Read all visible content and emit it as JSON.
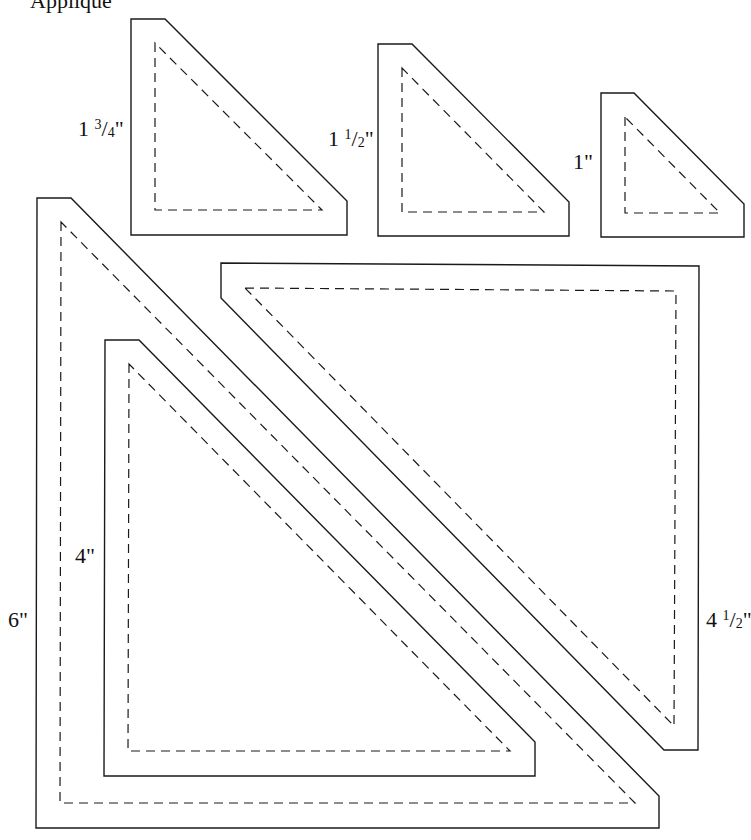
{
  "title_fragment": "Appliqué",
  "stroke_color": "#1a1a1a",
  "pieces": [
    {
      "id": "tri-1-3-4",
      "label_whole": "1",
      "label_num": "3",
      "label_den": "4",
      "label_unit": "\"",
      "label_pos": [
        78,
        118
      ],
      "outer": "131,19 165,19 347,201 347,235 131,235",
      "inner": "155,43 155,210 322,210 155,43"
    },
    {
      "id": "tri-1-1-2",
      "label_whole": "1",
      "label_num": "1",
      "label_den": "2",
      "label_unit": "\"",
      "label_pos": [
        328,
        128
      ],
      "outer": "378,44 412,44 569,202 569,236 378,236",
      "inner": "402,68 402,212 544,212 402,68"
    },
    {
      "id": "tri-1",
      "label_whole": "1\"",
      "label_pos": [
        573,
        151
      ],
      "outer": "601,93 634,93 744,204 744,237 601,237",
      "inner": "625,117 625,213 720,213 625,117"
    },
    {
      "id": "tri-6",
      "label_whole": "6\"",
      "label_pos": [
        8,
        609
      ],
      "outer": "37,198 71,198 659,796 659,828 36,828",
      "inner": "61,222 60,803 635,803 61,222"
    },
    {
      "id": "tri-4",
      "label_whole": "4\"",
      "label_pos": [
        75,
        545
      ],
      "outer": "105,340 139,340 535,742 535,776 104,776",
      "inner": "129,364 128,751 510,751 129,364"
    },
    {
      "id": "tri-4-1-2",
      "label_whole": "4",
      "label_num": "1",
      "label_den": "2",
      "label_unit": "\"",
      "label_pos": [
        706,
        609
      ],
      "outer": "221,263 699,266 698,750 664,750 221,298",
      "inner": "245,288 676,291 674,726 245,288"
    }
  ]
}
